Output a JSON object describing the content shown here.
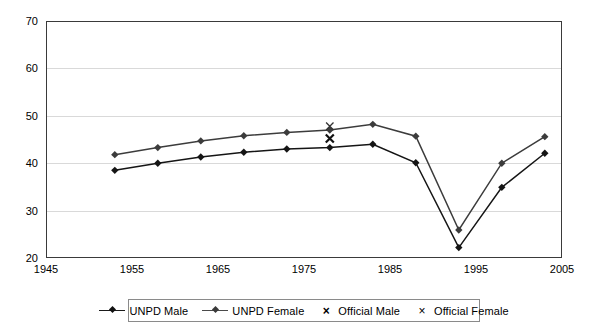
{
  "chart_data": {
    "type": "line",
    "title": "",
    "xlabel": "",
    "ylabel": "",
    "xlim": [
      1945,
      2005
    ],
    "ylim": [
      20,
      70
    ],
    "xticks": [
      1945,
      1955,
      1965,
      1975,
      1985,
      1995,
      2005
    ],
    "yticks": [
      20,
      30,
      40,
      50,
      60,
      70
    ],
    "grid": "horizontal",
    "legend_position": "bottom",
    "series": [
      {
        "name": "UNPD Male",
        "marker": "diamond",
        "style": "line",
        "color": "#151515",
        "x": [
          1953,
          1958,
          1963,
          1968,
          1973,
          1978,
          1983,
          1988,
          1993,
          1998,
          2003
        ],
        "values": [
          38.5,
          40.0,
          41.3,
          42.3,
          43.0,
          43.3,
          44.0,
          40.1,
          22.2,
          34.9,
          42.1
        ]
      },
      {
        "name": "UNPD Female",
        "marker": "diamond",
        "style": "line",
        "color": "#3c3c3c",
        "x": [
          1953,
          1958,
          1963,
          1968,
          1973,
          1978,
          1983,
          1988,
          1993,
          1998,
          2003
        ],
        "values": [
          41.8,
          43.3,
          44.7,
          45.8,
          46.5,
          47.0,
          48.2,
          45.7,
          25.9,
          40.0,
          45.6
        ]
      },
      {
        "name": "Official Male",
        "marker": "x-bold",
        "style": "markers",
        "color": "#111111",
        "x": [
          1978
        ],
        "values": [
          45.2
        ]
      },
      {
        "name": "Official Female",
        "marker": "x-thin",
        "style": "markers",
        "color": "#333333",
        "x": [
          1978
        ],
        "values": [
          47.8
        ]
      }
    ]
  },
  "axes": {
    "y_tick_labels": [
      "20",
      "30",
      "40",
      "50",
      "60",
      "70"
    ],
    "x_tick_labels": [
      "1945",
      "1955",
      "1965",
      "1975",
      "1985",
      "1995",
      "2005"
    ]
  },
  "legend": {
    "items": [
      {
        "label": "UNPD Male",
        "symbol": "line-diamond-marker"
      },
      {
        "label": "UNPD Female",
        "symbol": "line-diamond-marker"
      },
      {
        "label": "Official Male",
        "symbol": "x-bold-marker"
      },
      {
        "label": "Official Female",
        "symbol": "x-thin-marker"
      }
    ]
  }
}
